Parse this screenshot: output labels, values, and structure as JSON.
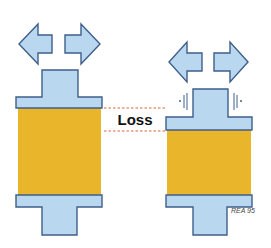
{
  "diagram": {
    "label": "Loss",
    "watermark": "REA 95",
    "colors": {
      "shaft_fill": "#b9d8ef",
      "shaft_outline": "#3f5e8a",
      "body_fill": "#e9b52a",
      "dashed_line": "#d8623a",
      "background": "#ffffff"
    },
    "left_figure": {
      "description": "Uncompressed element with outward arrows",
      "arrows": [
        "arrow-left",
        "arrow-right"
      ]
    },
    "right_figure": {
      "description": "Compressed element with outward arrows and vibration marks",
      "arrows": [
        "arrow-left",
        "arrow-right"
      ],
      "vibration_marks": 2
    }
  }
}
